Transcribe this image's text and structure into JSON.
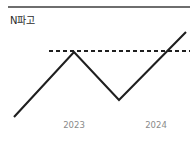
{
  "canvas": {
    "width": 196,
    "height": 141,
    "background": "#ffffff"
  },
  "header": {
    "title": "N파고",
    "title_color": "#2b2b2b",
    "divider_color": "#6e6e6e"
  },
  "chart_data": {
    "type": "line",
    "title": "N파고",
    "xlabel": "",
    "ylabel": "",
    "grid": false,
    "legend": null,
    "x_tick_labels": [
      "2023",
      "2024"
    ],
    "tick_label_color": "#8a8a8a",
    "series": [
      {
        "name": "N파고",
        "style": "solid",
        "color": "#1f1f1f",
        "points": [
          {
            "x": 0.0,
            "y": 0.0
          },
          {
            "x": 0.35,
            "y": 0.76
          },
          {
            "x": 0.61,
            "y": 0.2
          },
          {
            "x": 1.0,
            "y": 1.0
          }
        ]
      }
    ],
    "annotations": [
      {
        "name": "threshold",
        "type": "horizontal-dashed-line",
        "y": 0.76,
        "color": "#1f1f1f",
        "label": ""
      }
    ],
    "geometry_px": {
      "series_path": "M 14 117 L 74 52 L 119 100 L 186 32",
      "threshold_path": "M 49 51 L 190 51",
      "tick_positions_px": [
        74,
        156
      ],
      "tick_label_y_px": 120
    }
  }
}
